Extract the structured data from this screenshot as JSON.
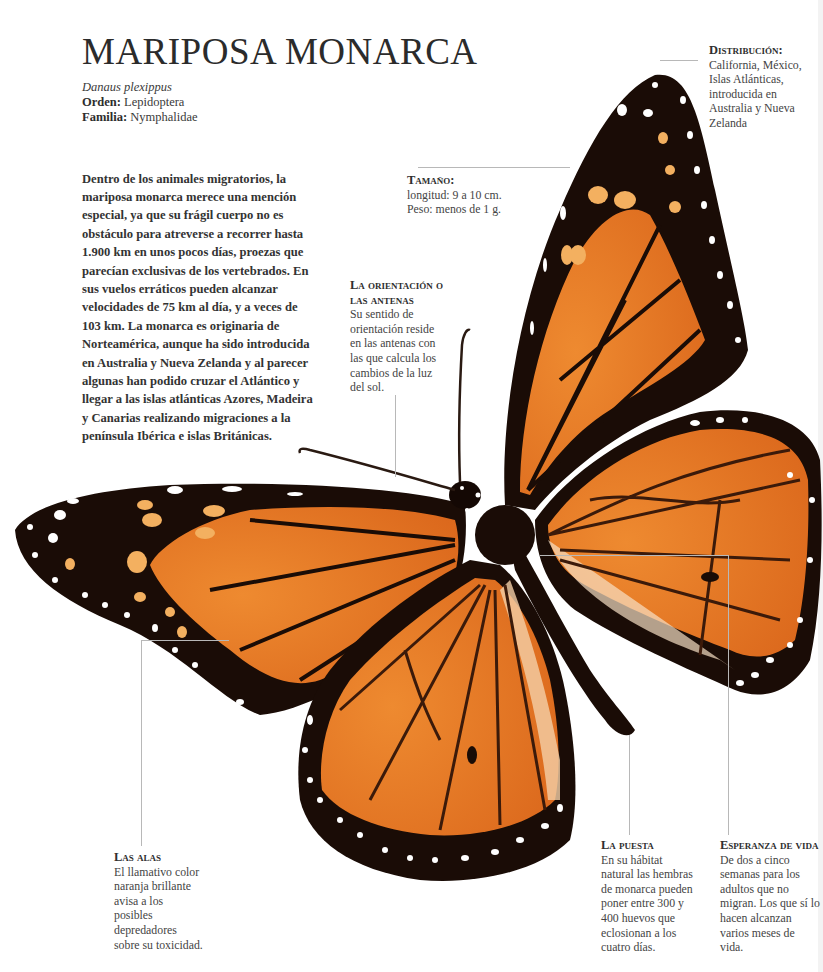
{
  "page": {
    "title": "MARIPOSA MONARCA",
    "scientific_name": "Danaus plexippus",
    "order_label": "Orden:",
    "order_value": "Lepidoptera",
    "family_label": "Familia:",
    "family_value": "Nymphalidae"
  },
  "intro": {
    "text": "Dentro de los animales migratorios, la mariposa monarca merece una mención especial, ya que su frágil cuerpo no es obstáculo para atreverse a recorrer hasta 1.900 km en unos pocos días, proezas que parecían exclusivas de los vertebrados. En sus vuelos erráticos pueden alcanzar velocidades de 75 km al día, y a veces de 103 km. La monarca es originaria de Norteamérica, aunque ha sido introducida en Australia y Nueva Zelanda y al parecer algunas han podido cruzar el Atlántico y llegar a las islas atlánticas Azores, Madeira y Canarias realizando migraciones a la península Ibérica e islas Británicas."
  },
  "callouts": {
    "distribucion": {
      "heading": "Distribución:",
      "text": "California, México, Islas Atlánticas, introducida en Australia y Nueva Zelanda"
    },
    "tamano": {
      "heading": "Tamaño:",
      "line1": "longitud: 9 a 10 cm.",
      "line2": "Peso: menos de 1 g."
    },
    "orientacion": {
      "heading": "La orientación o las antenas",
      "text": "Su sentido de orientación reside en las antenas con las que calcula los cambios de la luz del sol."
    },
    "alas": {
      "heading": "Las alas",
      "text": "El llamativo color naranja brillante avisa a los posibles depredadores sobre su toxicidad."
    },
    "puesta": {
      "heading": "La puesta",
      "text": "En su hábitat natural las hembras de monarca pueden poner entre 300 y 400 huevos que eclosionan a los cuatro días."
    },
    "esperanza": {
      "heading": "Esperanza de vida",
      "text": "De dos a cinco semanas para los adultos que no migran. Los que sí lo hacen alcanzan varios meses de vida."
    }
  },
  "illustration": {
    "subject": "monarch-butterfly",
    "colors": {
      "wing_orange": "#e0701e",
      "wing_orange_light": "#f0a050",
      "border_black": "#1a0c06",
      "spots_white": "#ffffff",
      "spots_pale_orange": "#f3b060",
      "leader_line": "#b8b8b8"
    }
  }
}
